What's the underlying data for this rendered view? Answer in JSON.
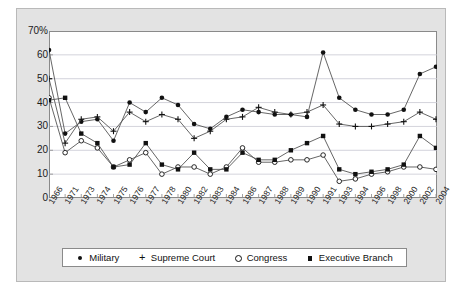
{
  "chart_data": {
    "type": "line",
    "title": "",
    "subtitle": "",
    "xlabel": "",
    "ylabel": "",
    "ylim": [
      0,
      70
    ],
    "yticks": [
      0,
      10,
      20,
      30,
      40,
      50,
      60,
      70
    ],
    "ytick_labels": [
      "0",
      "10",
      "20",
      "30",
      "40",
      "50",
      "60",
      "70%"
    ],
    "grid": true,
    "grid_axis": "y",
    "legend_position": "bottom",
    "categories": [
      "1966",
      "1971",
      "1973",
      "1974",
      "1975",
      "1976",
      "1977",
      "1978",
      "1980",
      "1982",
      "1983",
      "1984",
      "1986",
      "1987",
      "1988",
      "1989",
      "1990",
      "1991",
      "1993",
      "1994",
      "1996",
      "1998",
      "2000",
      "2002",
      "2004"
    ],
    "series": [
      {
        "name": "Military",
        "marker": "circle-filled",
        "values": [
          62,
          27,
          32,
          33,
          24,
          40,
          36,
          42,
          39,
          31,
          29,
          34,
          37,
          36,
          35,
          35,
          34,
          61,
          42,
          37,
          35,
          35,
          37,
          52,
          55
        ]
      },
      {
        "name": "Supreme Court",
        "marker": "plus",
        "values": [
          50,
          23,
          33,
          34,
          28,
          36,
          32,
          35,
          33,
          25,
          28,
          33,
          34,
          38,
          36,
          35,
          36,
          39,
          31,
          30,
          30,
          31,
          32,
          36,
          33
        ]
      },
      {
        "name": "Congress",
        "marker": "circle-open",
        "values": [
          42,
          19,
          24,
          21,
          13,
          16,
          19,
          10,
          13,
          13,
          10,
          13,
          21,
          15,
          15,
          16,
          16,
          18,
          7,
          8,
          10,
          11,
          13,
          13,
          12
        ]
      },
      {
        "name": "Executive Branch",
        "marker": "square-filled",
        "values": [
          41,
          42,
          27,
          23,
          13,
          14,
          23,
          14,
          12,
          19,
          12,
          12,
          19,
          16,
          16,
          20,
          23,
          26,
          12,
          10,
          11,
          12,
          14,
          26,
          21
        ]
      }
    ]
  },
  "legend": {
    "items": [
      {
        "label": "Military",
        "marker": "circle-filled"
      },
      {
        "label": "Supreme Court",
        "marker": "plus"
      },
      {
        "label": "Congress",
        "marker": "circle-open"
      },
      {
        "label": "Executive Branch",
        "marker": "square-filled"
      }
    ]
  },
  "colors": {
    "series_line": "#555555",
    "marker": "#111111",
    "grid": "#c8c8d2",
    "axis": "#8a8a8a",
    "panel_background": "#e3e3e3",
    "plot_background": "#ffffff",
    "text": "#1b1b1b"
  }
}
